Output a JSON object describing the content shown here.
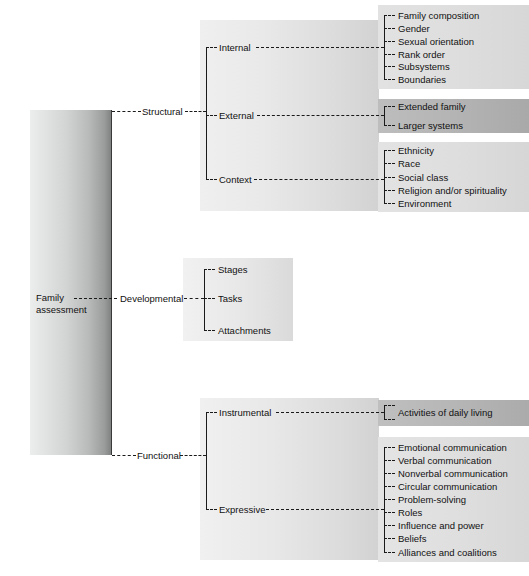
{
  "diagram": {
    "title": "Family assessment",
    "root": {
      "label": "Family assessment"
    },
    "branches": [
      {
        "id": "structural",
        "label": "Structural",
        "children": [
          {
            "id": "internal",
            "label": "Internal",
            "leaves": [
              "Family composition",
              "Gender",
              "Sexual orientation",
              "Rank order",
              "Subsystems",
              "Boundaries"
            ]
          },
          {
            "id": "external",
            "label": "External",
            "leaves": [
              "Extended family",
              "Larger systems"
            ]
          },
          {
            "id": "context",
            "label": "Context",
            "leaves": [
              "Ethnicity",
              "Race",
              "Social class",
              "Religion and/or spirituality",
              "Environment"
            ]
          }
        ]
      },
      {
        "id": "developmental",
        "label": "Developmental",
        "children": [
          {
            "id": "stages",
            "label": "Stages",
            "leaves": []
          },
          {
            "id": "tasks",
            "label": "Tasks",
            "leaves": []
          },
          {
            "id": "attachments",
            "label": "Attachments",
            "leaves": []
          }
        ]
      },
      {
        "id": "functional",
        "label": "Functional",
        "children": [
          {
            "id": "instrumental",
            "label": "Instrumental",
            "leaves": [
              "Activities of daily living"
            ]
          },
          {
            "id": "expressive",
            "label": "Expressive",
            "leaves": [
              "Emotional communication",
              "Verbal communication",
              "Nonverbal communication",
              "Circular communication",
              "Problem-solving",
              "Roles",
              "Influence and power",
              "Beliefs",
              "Alliances and coalitions"
            ]
          }
        ]
      }
    ]
  },
  "colors": {
    "line": "#1a1a1a",
    "text": "#111111",
    "panel_light": "#e9e9e9",
    "panel_dark": "#b4b4b4",
    "background": "#ffffff"
  }
}
